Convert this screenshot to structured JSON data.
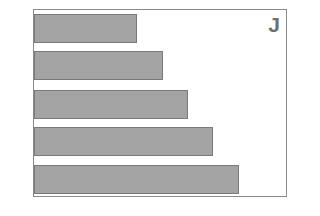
{
  "chart_data": {
    "type": "bar",
    "orientation": "horizontal",
    "title": "",
    "panel_label": "J",
    "xlabel": "",
    "ylabel": "",
    "categories": [
      "1",
      "2",
      "3",
      "4",
      "5"
    ],
    "values": [
      103,
      129,
      154,
      179,
      205
    ],
    "xlim": [
      0,
      254
    ],
    "grid": false,
    "legend": null,
    "bar_fill": "#b9b9b9",
    "bar_pattern": "dotted",
    "bar_border": "#7a7a7a",
    "frame_color": "#8a8a8a"
  }
}
